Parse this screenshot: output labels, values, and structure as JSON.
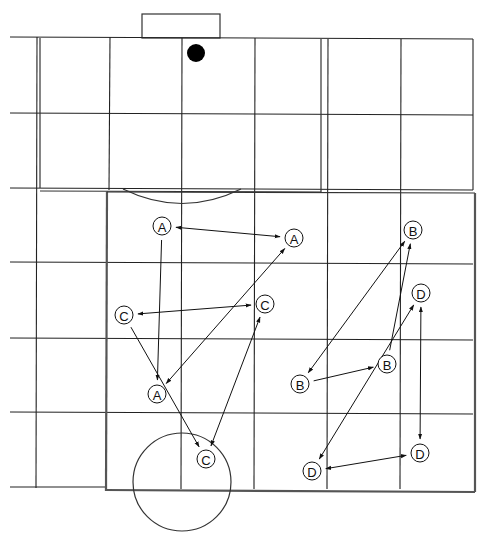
{
  "diagram": {
    "colors": {
      "line": "#222222",
      "background": "#ffffff",
      "marker": "#000000"
    },
    "players": [
      {
        "id": "A1",
        "label": "A",
        "group": "A"
      },
      {
        "id": "A2",
        "label": "A",
        "group": "A"
      },
      {
        "id": "A3",
        "label": "A",
        "group": "A"
      },
      {
        "id": "B1",
        "label": "B",
        "group": "B"
      },
      {
        "id": "B2",
        "label": "B",
        "group": "B"
      },
      {
        "id": "B3",
        "label": "B",
        "group": "B"
      },
      {
        "id": "C1",
        "label": "C",
        "group": "C"
      },
      {
        "id": "C2",
        "label": "C",
        "group": "C"
      },
      {
        "id": "C3",
        "label": "C",
        "group": "C"
      },
      {
        "id": "D1",
        "label": "D",
        "group": "D"
      },
      {
        "id": "D2",
        "label": "D",
        "group": "D"
      },
      {
        "id": "D3",
        "label": "D",
        "group": "D"
      }
    ],
    "connections": [
      {
        "from": "A1",
        "to": "A2",
        "type": "double"
      },
      {
        "from": "A1",
        "to": "A3",
        "type": "single"
      },
      {
        "from": "A2",
        "to": "A3",
        "type": "double"
      },
      {
        "from": "C1",
        "to": "C2",
        "type": "double"
      },
      {
        "from": "C1",
        "to": "C3",
        "type": "single"
      },
      {
        "from": "C2",
        "to": "C3",
        "type": "double"
      },
      {
        "from": "B1",
        "to": "B2",
        "type": "double"
      },
      {
        "from": "B2",
        "to": "B3",
        "type": "single"
      },
      {
        "from": "B3",
        "to": "B1",
        "type": "single"
      },
      {
        "from": "D1",
        "to": "D3",
        "type": "double"
      },
      {
        "from": "D2",
        "to": "D3",
        "type": "double"
      },
      {
        "from": "D1",
        "to": "D2",
        "type": "double"
      }
    ],
    "markers": [
      {
        "name": "ball",
        "shape": "filled-circle"
      }
    ]
  }
}
